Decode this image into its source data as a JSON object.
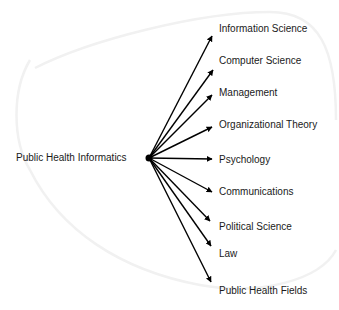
{
  "diagram": {
    "type": "fan-out",
    "source": "Public Health Informatics",
    "targets": [
      "Information Science",
      "Computer Science",
      "Management",
      "Organizational Theory",
      "Psychology",
      "Communications",
      "Political Science",
      "Law",
      "Public Health Fields"
    ],
    "edge_color": "#000000",
    "text_color": "#1a1a1a"
  }
}
